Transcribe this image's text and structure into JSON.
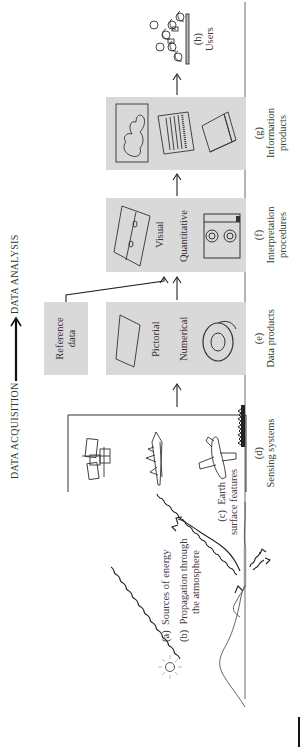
{
  "header": {
    "left_label": "DATA ACQUISITION",
    "right_label": "DATA ANALYSIS",
    "arrow_icon": "long-right-arrow"
  },
  "stages": {
    "a": {
      "tag": "(a)",
      "label": "Sources of energy"
    },
    "b": {
      "tag": "(b)",
      "label_line1": "Propagation through",
      "label_line2": "the atmosphere"
    },
    "c": {
      "tag": "(c)",
      "label_line1": "Earth",
      "label_line2": "surface features"
    },
    "d": {
      "tag": "(d)",
      "label": "Sensing systems",
      "icons": [
        "satellite",
        "space-shuttle",
        "airplane"
      ]
    },
    "e": {
      "tag": "(e)",
      "label": "Data products",
      "items": [
        "Pictorial",
        "Numerical"
      ]
    },
    "reference": {
      "line1": "Reference",
      "line2": "data"
    },
    "f": {
      "tag": "(f)",
      "label_line1": "Interpretation",
      "label_line2": "procedures",
      "items": [
        "Visual",
        "Quantitative"
      ]
    },
    "g": {
      "tag": "(g)",
      "label_line1": "Information",
      "label_line2": "products",
      "icons": [
        "map",
        "data-table",
        "report-book"
      ]
    },
    "h": {
      "tag": "(h)",
      "label": "Users"
    }
  },
  "colors": {
    "box_fill": "#d9d9d9",
    "line": "#222222",
    "text": "#333333"
  }
}
